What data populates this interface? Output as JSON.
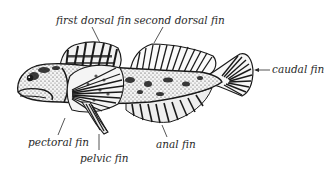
{
  "diagram": {
    "labels": {
      "first_dorsal_fin": "first dorsal fin",
      "second_dorsal_fin": "second dorsal fin",
      "caudal_fin": "caudal fin",
      "pectoral_fin": "pectoral fin",
      "pelvic_fin": "pelvic fin",
      "anal_fin": "anal fin"
    },
    "colors": {
      "ink": "#1a1a1a",
      "label": "#2a2a2a",
      "background": "#ffffff"
    }
  }
}
